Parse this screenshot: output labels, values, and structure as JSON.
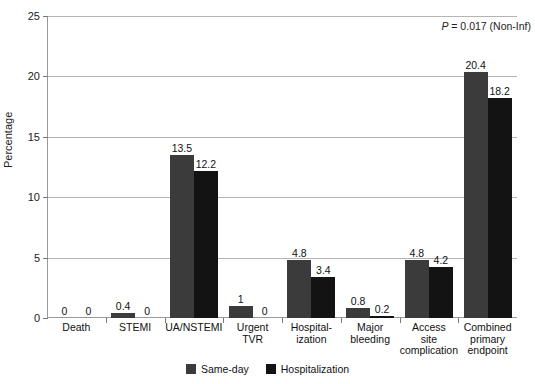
{
  "chart_data": {
    "type": "bar",
    "title": "",
    "xlabel": "",
    "ylabel": "Percentage",
    "ylim": [
      0,
      25
    ],
    "yticks": [
      0,
      5,
      10,
      15,
      20,
      25
    ],
    "grid": true,
    "legend_position": "bottom",
    "annotation": "P = 0.017 (Non-Inf)",
    "annotation_italic_prefix": "P",
    "annotation_rest": " = 0.017 (Non-Inf)",
    "categories": [
      "Death",
      "STEMI",
      "UA/NSTEMI",
      "Urgent TVR",
      "Hospitalization",
      "Major bleeding",
      "Access site complication",
      "Combined primary endpoint"
    ],
    "category_lines": [
      [
        "Death"
      ],
      [
        "STEMI"
      ],
      [
        "UA/NSTEMI"
      ],
      [
        "Urgent",
        "TVR"
      ],
      [
        "Hospital-",
        "ization"
      ],
      [
        "Major",
        "bleeding"
      ],
      [
        "Access",
        "site",
        "complication"
      ],
      [
        "Combined",
        "primary",
        "endpoint"
      ]
    ],
    "series": [
      {
        "name": "Same-day",
        "color": "#3b3b3b",
        "values": [
          0,
          0.4,
          13.5,
          1,
          4.8,
          0.8,
          4.8,
          20.4
        ],
        "labels": [
          "0",
          "0.4",
          "13.5",
          "1",
          "4.8",
          "0.8",
          "4.8",
          "20.4"
        ]
      },
      {
        "name": "Hospitalization",
        "color": "#131313",
        "values": [
          0,
          0,
          12.2,
          0,
          3.4,
          0.2,
          4.2,
          18.2
        ],
        "labels": [
          "0",
          "0",
          "12.2",
          "0",
          "3.4",
          "0.2",
          "4.2",
          "18.2"
        ]
      }
    ]
  },
  "legend": {
    "items": [
      {
        "label": "Same-day",
        "color": "#3b3b3b"
      },
      {
        "label": "Hospitalization",
        "color": "#131313"
      }
    ]
  },
  "axis": {
    "y_title": "Percentage",
    "y_tick_labels": [
      "0",
      "5",
      "10",
      "15",
      "20",
      "25"
    ]
  }
}
